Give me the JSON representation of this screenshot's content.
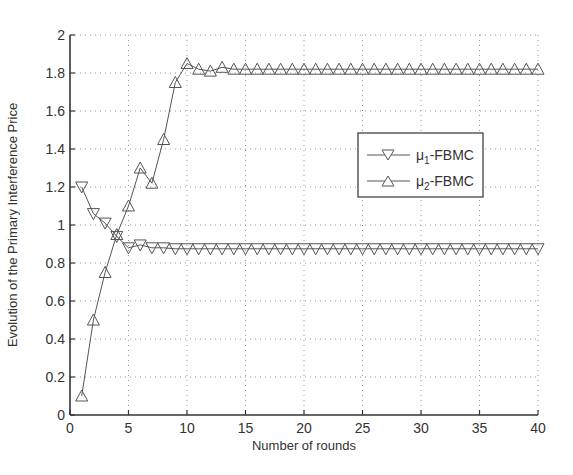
{
  "chart_data": {
    "type": "line",
    "title": "",
    "xlabel": "Number of rounds",
    "ylabel": "Evolution of the Primary Interference Price",
    "xlim": [
      0,
      40
    ],
    "ylim": [
      0,
      2
    ],
    "x_ticks": [
      0,
      5,
      10,
      15,
      20,
      25,
      30,
      35,
      40
    ],
    "y_ticks": [
      0,
      0.2,
      0.4,
      0.6,
      0.8,
      1,
      1.2,
      1.4,
      1.6,
      1.8,
      2
    ],
    "x_tick_labels": [
      "0",
      "5",
      "10",
      "15",
      "20",
      "25",
      "30",
      "35",
      "40"
    ],
    "y_tick_labels": [
      "0",
      "0.2",
      "0.4",
      "0.6",
      "0.8",
      "1",
      "1.2",
      "1.4",
      "1.6",
      "1.8",
      "2"
    ],
    "grid": true,
    "legend_position": "right-center",
    "x": [
      1,
      2,
      3,
      4,
      5,
      6,
      7,
      8,
      9,
      10,
      11,
      12,
      13,
      14,
      15,
      16,
      17,
      18,
      19,
      20,
      21,
      22,
      23,
      24,
      25,
      26,
      27,
      28,
      29,
      30,
      31,
      32,
      33,
      34,
      35,
      36,
      37,
      38,
      39,
      40
    ],
    "series": [
      {
        "name": "μ1-FBMC",
        "legend_main": "μ",
        "legend_sub": "1",
        "legend_suffix": "-FBMC",
        "marker": "triangle-down",
        "values": [
          1.2,
          1.06,
          1.01,
          0.94,
          0.88,
          0.895,
          0.88,
          0.88,
          0.875,
          0.875,
          0.875,
          0.875,
          0.875,
          0.875,
          0.875,
          0.875,
          0.875,
          0.875,
          0.875,
          0.875,
          0.875,
          0.875,
          0.875,
          0.875,
          0.875,
          0.875,
          0.875,
          0.875,
          0.875,
          0.875,
          0.875,
          0.875,
          0.875,
          0.875,
          0.875,
          0.875,
          0.875,
          0.875,
          0.875,
          0.875
        ]
      },
      {
        "name": "μ2-FBMC",
        "legend_main": "μ",
        "legend_sub": "2",
        "legend_suffix": "-FBMC",
        "marker": "triangle-up",
        "values": [
          0.1,
          0.5,
          0.75,
          0.95,
          1.1,
          1.3,
          1.22,
          1.45,
          1.75,
          1.85,
          1.82,
          1.81,
          1.83,
          1.82,
          1.82,
          1.82,
          1.82,
          1.82,
          1.82,
          1.82,
          1.82,
          1.82,
          1.82,
          1.82,
          1.82,
          1.82,
          1.82,
          1.82,
          1.82,
          1.82,
          1.82,
          1.82,
          1.82,
          1.82,
          1.82,
          1.82,
          1.82,
          1.82,
          1.82,
          1.82
        ]
      }
    ]
  },
  "colors": {
    "axis": "#333333",
    "grid": "#9a9a9a",
    "line": "#555555",
    "marker_stroke": "#555555",
    "background": "#ffffff"
  }
}
